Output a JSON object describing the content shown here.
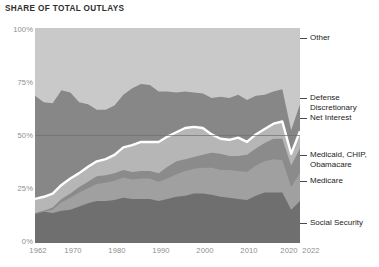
{
  "chart_title": "SHARE OF TOTAL OUTLAYS",
  "axes": {
    "y_ticks": [
      "0%",
      "25%",
      "50%",
      "75%",
      "100%"
    ],
    "x_ticks": [
      "1962",
      "1970",
      "1980",
      "1990",
      "2000",
      "2010",
      "2020",
      "2022"
    ]
  },
  "annotations": {
    "other": "Other",
    "defense_discretionary": "Defense\nDiscretionary",
    "net_interest": "Net Interest",
    "medicaid": "Medicaid, CHIP,\nObamacare",
    "medicare": "Medicare",
    "social_security": "Social Security"
  },
  "colors": {
    "background": "#ffffff",
    "social_security": "#6f6f6f",
    "medicare": "#a0a0a0",
    "medicaid": "#8b8b8b",
    "net_interest_line": "#ffffff",
    "net_interest": "#b6b6b6",
    "defense_discretionary": "#878787",
    "other": "#c9c9c9",
    "gridline": "#777777",
    "axis_text": "#8e8e8e",
    "title_text": "#2e2e2e",
    "label_text": "#232323"
  },
  "chart_data": {
    "type": "area",
    "title": "SHARE OF TOTAL OUTLAYS",
    "xlabel": "",
    "ylabel": "Share of total outlays",
    "xlim": [
      1962,
      2022
    ],
    "ylim": [
      0,
      100
    ],
    "grid": true,
    "stacked": true,
    "legend_position": "right-callouts",
    "x": [
      1962,
      1964,
      1966,
      1968,
      1970,
      1972,
      1974,
      1976,
      1978,
      1980,
      1982,
      1984,
      1986,
      1988,
      1990,
      1992,
      1994,
      1996,
      1998,
      2000,
      2002,
      2004,
      2006,
      2008,
      2010,
      2012,
      2014,
      2016,
      2018,
      2020,
      2022
    ],
    "series": [
      {
        "name": "Social Security",
        "values": [
          13.5,
          14.5,
          14.0,
          15.0,
          15.5,
          17.0,
          18.5,
          19.5,
          19.5,
          20.0,
          21.0,
          20.5,
          20.5,
          20.5,
          19.5,
          20.5,
          21.5,
          22.0,
          23.0,
          23.0,
          22.5,
          21.5,
          21.0,
          20.5,
          20.0,
          22.0,
          23.5,
          23.5,
          23.5,
          15.5,
          19.5
        ]
      },
      {
        "name": "Medicare",
        "values": [
          0.0,
          0.0,
          1.5,
          4.0,
          5.5,
          6.5,
          7.0,
          8.0,
          8.5,
          9.0,
          9.5,
          9.0,
          9.5,
          9.5,
          9.0,
          9.5,
          10.5,
          11.5,
          11.5,
          12.0,
          12.5,
          12.5,
          13.0,
          13.0,
          13.0,
          14.0,
          14.5,
          15.5,
          15.0,
          10.5,
          13.0
        ]
      },
      {
        "name": "Medicaid, CHIP, Obamacare",
        "values": [
          0.5,
          0.5,
          1.0,
          1.5,
          2.0,
          2.5,
          3.0,
          3.5,
          3.5,
          3.5,
          3.5,
          3.5,
          3.5,
          3.5,
          4.0,
          5.5,
          6.0,
          5.5,
          5.5,
          6.0,
          7.0,
          7.5,
          6.5,
          7.0,
          8.0,
          8.0,
          8.5,
          9.5,
          10.0,
          10.0,
          11.5
        ]
      },
      {
        "name": "Net Interest",
        "values": [
          6.5,
          6.5,
          6.5,
          6.5,
          7.0,
          6.5,
          7.0,
          7.0,
          7.5,
          8.5,
          10.5,
          12.5,
          13.5,
          13.5,
          14.5,
          14.0,
          13.5,
          14.5,
          14.0,
          12.5,
          8.5,
          7.0,
          7.5,
          8.5,
          6.0,
          6.5,
          6.5,
          7.0,
          8.0,
          5.5,
          8.0
        ]
      },
      {
        "name": "Defense Discretionary",
        "values": [
          48.0,
          44.0,
          42.0,
          44.0,
          40.0,
          33.0,
          29.0,
          24.0,
          23.0,
          23.0,
          24.5,
          26.5,
          27.0,
          26.5,
          23.5,
          21.0,
          18.5,
          17.0,
          16.0,
          16.0,
          17.0,
          19.5,
          19.5,
          20.0,
          19.5,
          18.0,
          16.0,
          15.0,
          15.0,
          11.0,
          12.5
        ]
      },
      {
        "name": "Other",
        "values": [
          31.5,
          34.5,
          35.0,
          28.5,
          30.0,
          34.5,
          35.5,
          38.0,
          37.5,
          36.0,
          31.0,
          28.0,
          26.0,
          26.5,
          29.5,
          29.5,
          30.0,
          29.5,
          30.0,
          30.5,
          32.5,
          32.0,
          32.5,
          31.0,
          33.5,
          31.5,
          31.0,
          29.5,
          28.5,
          47.5,
          35.5
        ]
      }
    ]
  }
}
